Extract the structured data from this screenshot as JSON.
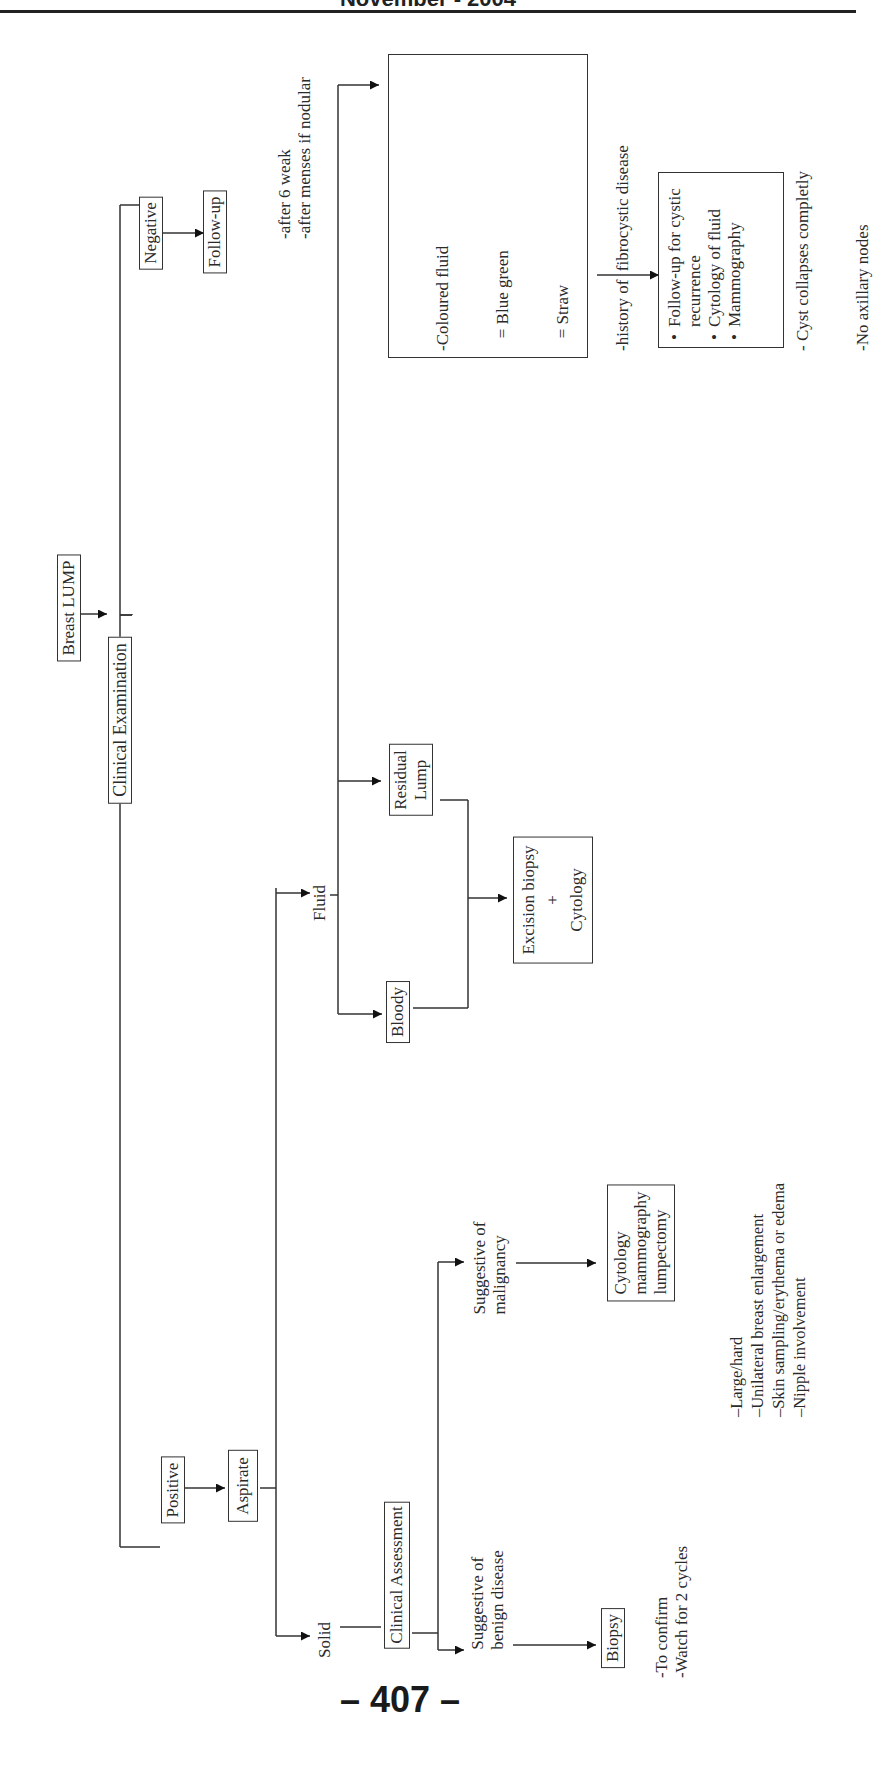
{
  "header": {
    "title": "November - 2004"
  },
  "page_number": "– 407 –",
  "flowchart": {
    "root": "Breast LUMP",
    "exam": "Clinical Examination",
    "negative": {
      "label": "Negative",
      "next": "Follow-up",
      "notes": [
        "-after 6 weak",
        "-after menses if nodular"
      ]
    },
    "positive": {
      "label": "Positive",
      "next": "Aspirate"
    },
    "fluid": {
      "label": "Fluid",
      "bloody": "Bloody",
      "residual": [
        "Residual",
        "Lump"
      ],
      "excision": [
        "Excision biopsy",
        "+",
        "Cytology"
      ],
      "criteria": [
        "-Coloured fluid",
        "   = Blue green",
        "   = Straw",
        "-history of  fibrocystic disease",
        "+",
        "> 1 lump palpable",
        "- Cyst collapses completly",
        "-No axillary nodes"
      ],
      "followup_list": [
        "Follow-up for cystic recurrence",
        "Cytology of fluid",
        "Mammography"
      ]
    },
    "solid": {
      "label": "Solid",
      "assessment": "Clinical Assessment",
      "malignancy": [
        "Suggestive of",
        "malignancy"
      ],
      "malignancy_action": [
        "Cytology",
        "mammography",
        "lumpectomy"
      ],
      "malignancy_signs": [
        "–Large/hard",
        "–Unilateral breast enlargement",
        "–Skin sampling/erythema or edema",
        "–Nipple involvement"
      ],
      "benign": [
        "Suggestive of",
        "benign disease"
      ],
      "benign_action": "Biopsy",
      "benign_notes": [
        "-To confirm",
        "-Watch for 2 cycles"
      ]
    }
  }
}
